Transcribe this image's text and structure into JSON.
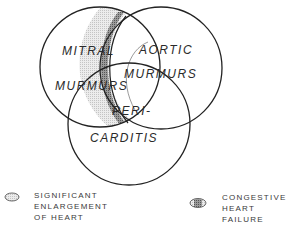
{
  "diagram": {
    "type": "venn",
    "sets": [
      {
        "id": "mitral",
        "label_line1": "MITRAL",
        "label_line2": "MURMURS"
      },
      {
        "id": "aortic",
        "label_line1": "AORTIC",
        "label_line2": "MURMURS"
      },
      {
        "id": "pericarditis",
        "label_line1": "PERI-",
        "label_line2": "CARDITIS"
      }
    ],
    "colors": {
      "stroke": "#222222",
      "enlargement_fill": "#d8d8d8",
      "failure_fill": "#8a8a8a"
    }
  },
  "legend": [
    {
      "label_lines": [
        "SIGNIFICANT",
        "ENLARGEMENT",
        "OF HEART"
      ],
      "pattern": "light-hatch"
    },
    {
      "label_lines": [
        "CONGESTIVE",
        "HEART",
        "FAILURE"
      ],
      "pattern": "dark-hatch"
    }
  ]
}
